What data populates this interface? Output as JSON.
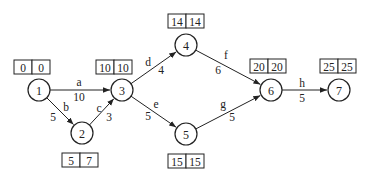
{
  "nodes": [
    {
      "id": "1",
      "label": "1",
      "cx": 39,
      "cy": 90,
      "times": [
        "0",
        "0"
      ],
      "box": {
        "x": 14,
        "y": 60
      }
    },
    {
      "id": "2",
      "label": "2",
      "cx": 82,
      "cy": 133,
      "times": [
        "5",
        "7"
      ],
      "box": {
        "x": 62,
        "y": 153
      }
    },
    {
      "id": "3",
      "label": "3",
      "cx": 122,
      "cy": 90,
      "times": [
        "10",
        "10"
      ],
      "box": {
        "x": 96,
        "y": 60
      }
    },
    {
      "id": "4",
      "label": "4",
      "cx": 186,
      "cy": 45,
      "times": [
        "14",
        "14"
      ],
      "box": {
        "x": 168,
        "y": 14
      }
    },
    {
      "id": "5",
      "label": "5",
      "cx": 186,
      "cy": 134,
      "times": [
        "15",
        "15"
      ],
      "box": {
        "x": 168,
        "y": 154
      }
    },
    {
      "id": "6",
      "label": "6",
      "cx": 271,
      "cy": 90,
      "times": [
        "20",
        "20"
      ],
      "box": {
        "x": 250,
        "y": 59
      }
    },
    {
      "id": "7",
      "label": "7",
      "cx": 339,
      "cy": 90,
      "times": [
        "25",
        "25"
      ],
      "box": {
        "x": 320,
        "y": 59
      }
    }
  ],
  "edges": [
    {
      "from": "1",
      "to": "3",
      "name": "a",
      "weight": "10",
      "nx": 79,
      "ny": 82,
      "wx": 79,
      "wy": 97
    },
    {
      "from": "1",
      "to": "2",
      "name": "b",
      "weight": "5",
      "nx": 66,
      "ny": 107,
      "wx": 53,
      "wy": 117
    },
    {
      "from": "2",
      "to": "3",
      "name": "c",
      "weight": "3",
      "nx": 99,
      "ny": 108,
      "wx": 109,
      "wy": 117
    },
    {
      "from": "3",
      "to": "4",
      "name": "d",
      "weight": "4",
      "nx": 148,
      "ny": 62,
      "wx": 161,
      "wy": 70
    },
    {
      "from": "3",
      "to": "5",
      "name": "e",
      "weight": "5",
      "nx": 156,
      "ny": 104,
      "wx": 148,
      "wy": 116
    },
    {
      "from": "4",
      "to": "6",
      "name": "f",
      "weight": "6",
      "nx": 226,
      "ny": 55,
      "wx": 218,
      "wy": 70
    },
    {
      "from": "5",
      "to": "6",
      "name": "g",
      "weight": "5",
      "nx": 223,
      "ny": 104,
      "wx": 232,
      "wy": 117
    },
    {
      "from": "6",
      "to": "7",
      "name": "h",
      "weight": "5",
      "nx": 302,
      "ny": 83,
      "wx": 302,
      "wy": 98
    }
  ]
}
